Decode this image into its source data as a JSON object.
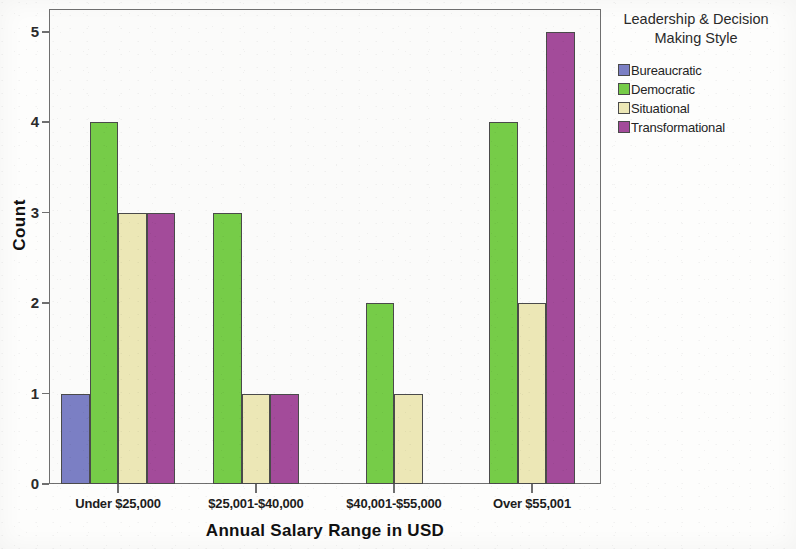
{
  "chart_data": {
    "type": "bar",
    "title": "",
    "subtitle": "",
    "xlabel": "Annual Salary Range in USD",
    "ylabel": "Count",
    "categories": [
      "Under $25,000",
      "$25,001-$40,000",
      "$40,001-$55,000",
      "Over $55,001"
    ],
    "series": [
      {
        "name": "Bureaucratic",
        "color": "#7b7fc4",
        "values": [
          1,
          0,
          0,
          0
        ]
      },
      {
        "name": "Democratic",
        "color": "#76cc48",
        "values": [
          4,
          3,
          2,
          4
        ]
      },
      {
        "name": "Situational",
        "color": "#ece7b6",
        "values": [
          3,
          1,
          1,
          2
        ]
      },
      {
        "name": "Transformational",
        "color": "#a34b9a",
        "values": [
          3,
          1,
          0,
          5
        ]
      }
    ],
    "ylim": [
      0,
      5
    ],
    "y_ticks": [
      "0",
      "1",
      "2",
      "3",
      "4",
      "5"
    ],
    "grid": false,
    "legend_position": "right",
    "legend_title": "Leadership & Decision Making Style",
    "bar_border_color": "#4a4a4a",
    "axis_color": "#6f6f6f",
    "plot_background": "#fbfbfa"
  },
  "legend": {
    "title_line1": "Leadership & Decision",
    "title_line2": "Making Style",
    "items": [
      {
        "label": "Bureaucratic",
        "color": "#7b7fc4"
      },
      {
        "label": "Democratic",
        "color": "#76cc48"
      },
      {
        "label": "Situational",
        "color": "#ece7b6"
      },
      {
        "label": "Transformational",
        "color": "#a34b9a"
      }
    ]
  },
  "axes": {
    "y_title": "Count",
    "x_title": "Annual Salary Range in USD"
  }
}
